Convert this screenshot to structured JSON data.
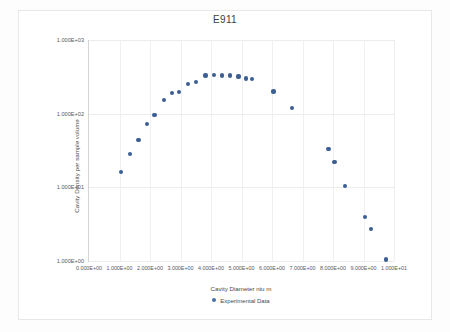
{
  "chart_data": {
    "type": "scatter",
    "title": "E911",
    "xlabel": "Cavity Diameter niu m",
    "ylabel": "Cavity Density per sample volume",
    "legend": [
      {
        "name": "Experimental Data",
        "color": "#3b5e93"
      }
    ],
    "legend_position": "bottom",
    "grid": true,
    "xscale": "linear",
    "yscale": "log",
    "xlim": [
      0,
      10
    ],
    "ylim": [
      1,
      1000
    ],
    "xticks": [
      "0.000E+00",
      "1.000E+00",
      "2.000E+00",
      "3.000E+00",
      "4.000E+00",
      "5.000E+00",
      "6.000E+00",
      "7.000E+00",
      "8.000E+00",
      "9.000E+00",
      "1.000E+01"
    ],
    "xtick_values": [
      0,
      1,
      2,
      3,
      4,
      5,
      6,
      7,
      8,
      9,
      10
    ],
    "yticks": [
      "1.000E+00",
      "1.000E+01",
      "1.000E+02",
      "1.000E+03"
    ],
    "ytick_values": [
      1,
      10,
      100,
      1000
    ],
    "series": [
      {
        "name": "Experimental Data",
        "color": "#3b5e93",
        "points": [
          {
            "x": 1.05,
            "y": 16
          },
          {
            "x": 1.35,
            "y": 28
          },
          {
            "x": 1.62,
            "y": 44
          },
          {
            "x": 1.9,
            "y": 72
          },
          {
            "x": 2.15,
            "y": 95
          },
          {
            "x": 2.45,
            "y": 155
          },
          {
            "x": 2.72,
            "y": 190
          },
          {
            "x": 2.95,
            "y": 195
          },
          {
            "x": 3.25,
            "y": 250
          },
          {
            "x": 3.52,
            "y": 270
          },
          {
            "x": 3.82,
            "y": 330
          },
          {
            "x": 4.1,
            "y": 335
          },
          {
            "x": 4.35,
            "y": 330
          },
          {
            "x": 4.62,
            "y": 330
          },
          {
            "x": 4.9,
            "y": 320
          },
          {
            "x": 5.15,
            "y": 300
          },
          {
            "x": 5.35,
            "y": 295
          },
          {
            "x": 6.05,
            "y": 200
          },
          {
            "x": 6.65,
            "y": 120
          },
          {
            "x": 7.85,
            "y": 33
          },
          {
            "x": 8.05,
            "y": 22
          },
          {
            "x": 8.4,
            "y": 10.5
          },
          {
            "x": 9.05,
            "y": 4.0
          },
          {
            "x": 9.25,
            "y": 2.7
          },
          {
            "x": 9.75,
            "y": 1.05
          }
        ]
      }
    ]
  }
}
